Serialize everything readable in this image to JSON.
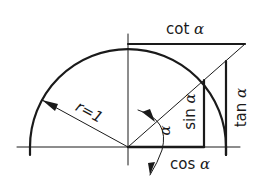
{
  "diagram": {
    "labels": {
      "radius": "r=1",
      "cot": "cot",
      "tan": "tan",
      "sin": "sin",
      "cos": "cos",
      "angle": "α",
      "alpha": "α"
    },
    "colors": {
      "stroke": "#1a1a1a",
      "background": "#ffffff"
    }
  }
}
